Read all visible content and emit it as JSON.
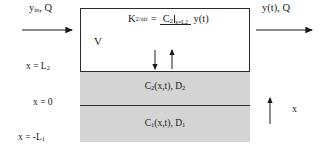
{
  "diagram": {
    "inlet_label": "y",
    "inlet_sub": "in",
    "inlet_rest": ", Q",
    "outlet_label": "y(t), Q",
    "volume_label": "V",
    "axis_arrow_label": "x",
    "axis_labels": [
      {
        "name": "x-equals-L2",
        "text": "x = L",
        "sub": "2"
      },
      {
        "name": "x-equals-0",
        "text": "x = 0",
        "sub": ""
      },
      {
        "name": "x-equals-minus-L1",
        "text": "x = -L",
        "sub": "1"
      }
    ],
    "layers": [
      {
        "name": "layer-2",
        "concentration": "C",
        "c_sub": "2",
        "args": "(x,t), D",
        "d_sub": "2"
      },
      {
        "name": "layer-1",
        "concentration": "C",
        "c_sub": "1",
        "args": "(x,t), D",
        "d_sub": "1"
      }
    ],
    "formula": {
      "lhs": "K",
      "lhs_sub": "2/air",
      "equals": "=",
      "numerator": "C",
      "numerator_sub": "2",
      "numerator_eval": "x=L",
      "numerator_eval_sub": "2",
      "denominator": "y(t)"
    },
    "interface_arrows": [
      {
        "name": "flux-arrow-down",
        "direction": "down"
      },
      {
        "name": "flux-arrow-up",
        "direction": "up"
      }
    ],
    "colors": {
      "layer_fill": "#d4d4d4",
      "headspace_fill": "#ffffff",
      "stroke": "#2b2b2b",
      "text": "#1a1a1a"
    }
  }
}
